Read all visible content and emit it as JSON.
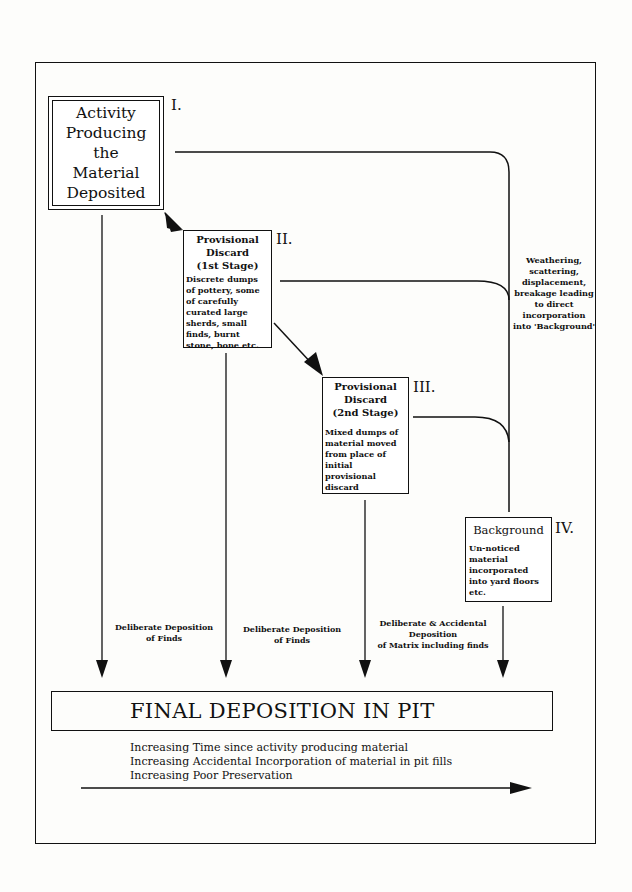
{
  "diagram": {
    "stages": [
      {
        "id": "I",
        "roman": "I.",
        "title_lines": [
          "Activity",
          "Producing",
          "the",
          "Material",
          "Deposited"
        ],
        "description": ""
      },
      {
        "id": "II",
        "roman": "II.",
        "title_lines": [
          "Provisional",
          "Discard",
          "(1st Stage)"
        ],
        "description": "Discrete dumps of pottery, some of carefully curated large sherds, small finds, burnt stone, bone etc."
      },
      {
        "id": "III",
        "roman": "III.",
        "title_lines": [
          "Provisional",
          "Discard",
          "(2nd Stage)"
        ],
        "description": "Mixed dumps of material moved from place of initial provisional discard"
      },
      {
        "id": "IV",
        "roman": "IV.",
        "title_lines": [
          "Background"
        ],
        "description": "Un-noticed material incorporated into yard floors etc."
      }
    ],
    "side_note": "Weathering, scattering, displacement, breakage leading to direct incorporation into 'Background'",
    "flow_labels": [
      {
        "line1": "Deliberate Deposition",
        "line2": "of Finds",
        "line3": ""
      },
      {
        "line1": "Deliberate Deposition",
        "line2": "of Finds",
        "line3": ""
      },
      {
        "line1": "Deliberate & Accidental",
        "line2": "Deposition",
        "line3": "of Matrix including finds"
      }
    ],
    "final": {
      "title": "FINAL DEPOSITION IN PIT"
    },
    "trends": [
      "Increasing Time since activity producing material",
      "Increasing Accidental Incorporation of material in pit fills",
      "Increasing Poor Preservation"
    ]
  }
}
